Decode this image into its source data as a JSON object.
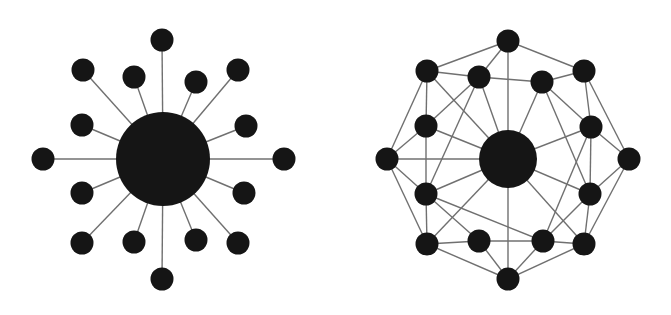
{
  "colors": {
    "background": "#ffffff",
    "node": "#151515",
    "edge": "#707070"
  },
  "diagrams": [
    {
      "id": "centralized",
      "label": "Centralized (star) network",
      "hub": {
        "x": 163,
        "y": 159,
        "r": 47
      },
      "node_radius": 11.5,
      "nodes": [
        {
          "id": "n1",
          "x": 162,
          "y": 40
        },
        {
          "id": "n2",
          "x": 83,
          "y": 70
        },
        {
          "id": "n3",
          "x": 134,
          "y": 77
        },
        {
          "id": "n4",
          "x": 196,
          "y": 82
        },
        {
          "id": "n5",
          "x": 238,
          "y": 70
        },
        {
          "id": "n6",
          "x": 82,
          "y": 125
        },
        {
          "id": "n7",
          "x": 246,
          "y": 126
        },
        {
          "id": "n8",
          "x": 43,
          "y": 159
        },
        {
          "id": "n9",
          "x": 284,
          "y": 159
        },
        {
          "id": "n10",
          "x": 82,
          "y": 193
        },
        {
          "id": "n11",
          "x": 244,
          "y": 193
        },
        {
          "id": "n12",
          "x": 82,
          "y": 243
        },
        {
          "id": "n13",
          "x": 134,
          "y": 242
        },
        {
          "id": "n14",
          "x": 196,
          "y": 240
        },
        {
          "id": "n15",
          "x": 238,
          "y": 243
        },
        {
          "id": "n16",
          "x": 162,
          "y": 279
        }
      ],
      "edges": [
        [
          "hub",
          "n1"
        ],
        [
          "hub",
          "n2"
        ],
        [
          "hub",
          "n3"
        ],
        [
          "hub",
          "n4"
        ],
        [
          "hub",
          "n5"
        ],
        [
          "hub",
          "n6"
        ],
        [
          "hub",
          "n7"
        ],
        [
          "hub",
          "n8"
        ],
        [
          "hub",
          "n9"
        ],
        [
          "hub",
          "n10"
        ],
        [
          "hub",
          "n11"
        ],
        [
          "hub",
          "n12"
        ],
        [
          "hub",
          "n13"
        ],
        [
          "hub",
          "n14"
        ],
        [
          "hub",
          "n15"
        ],
        [
          "hub",
          "n16"
        ]
      ]
    },
    {
      "id": "decentralized",
      "label": "Distributed (mesh) network",
      "hub": {
        "x": 508,
        "y": 159,
        "r": 29
      },
      "node_radius": 11.5,
      "nodes": [
        {
          "id": "T",
          "x": 508,
          "y": 41
        },
        {
          "id": "A",
          "x": 427,
          "y": 71
        },
        {
          "id": "B",
          "x": 479,
          "y": 77
        },
        {
          "id": "C",
          "x": 542,
          "y": 82
        },
        {
          "id": "D",
          "x": 584,
          "y": 71
        },
        {
          "id": "E",
          "x": 426,
          "y": 126
        },
        {
          "id": "F",
          "x": 591,
          "y": 127
        },
        {
          "id": "G",
          "x": 387,
          "y": 159
        },
        {
          "id": "H",
          "x": 629,
          "y": 159
        },
        {
          "id": "I",
          "x": 426,
          "y": 194
        },
        {
          "id": "J",
          "x": 590,
          "y": 194
        },
        {
          "id": "K",
          "x": 427,
          "y": 244
        },
        {
          "id": "L",
          "x": 479,
          "y": 241
        },
        {
          "id": "M",
          "x": 543,
          "y": 241
        },
        {
          "id": "N",
          "x": 584,
          "y": 244
        },
        {
          "id": "Bo",
          "x": 508,
          "y": 279
        }
      ],
      "edges": [
        [
          "T",
          "A"
        ],
        [
          "T",
          "B"
        ],
        [
          "T",
          "D"
        ],
        [
          "T",
          "hub"
        ],
        [
          "A",
          "B"
        ],
        [
          "A",
          "E"
        ],
        [
          "A",
          "G"
        ],
        [
          "A",
          "hub"
        ],
        [
          "B",
          "C"
        ],
        [
          "B",
          "E"
        ],
        [
          "B",
          "I"
        ],
        [
          "B",
          "hub"
        ],
        [
          "C",
          "D"
        ],
        [
          "C",
          "F"
        ],
        [
          "C",
          "J"
        ],
        [
          "C",
          "hub"
        ],
        [
          "D",
          "F"
        ],
        [
          "D",
          "H"
        ],
        [
          "E",
          "G"
        ],
        [
          "E",
          "I"
        ],
        [
          "E",
          "hub"
        ],
        [
          "F",
          "H"
        ],
        [
          "F",
          "J"
        ],
        [
          "F",
          "M"
        ],
        [
          "F",
          "hub"
        ],
        [
          "G",
          "I"
        ],
        [
          "G",
          "K"
        ],
        [
          "G",
          "hub"
        ],
        [
          "H",
          "J"
        ],
        [
          "H",
          "N"
        ],
        [
          "I",
          "K"
        ],
        [
          "I",
          "L"
        ],
        [
          "I",
          "M"
        ],
        [
          "I",
          "hub"
        ],
        [
          "J",
          "M"
        ],
        [
          "J",
          "N"
        ],
        [
          "J",
          "hub"
        ],
        [
          "K",
          "L"
        ],
        [
          "K",
          "Bo"
        ],
        [
          "K",
          "hub"
        ],
        [
          "L",
          "M"
        ],
        [
          "L",
          "Bo"
        ],
        [
          "M",
          "N"
        ],
        [
          "M",
          "Bo"
        ],
        [
          "N",
          "Bo"
        ],
        [
          "N",
          "hub"
        ],
        [
          "Bo",
          "hub"
        ]
      ]
    }
  ]
}
